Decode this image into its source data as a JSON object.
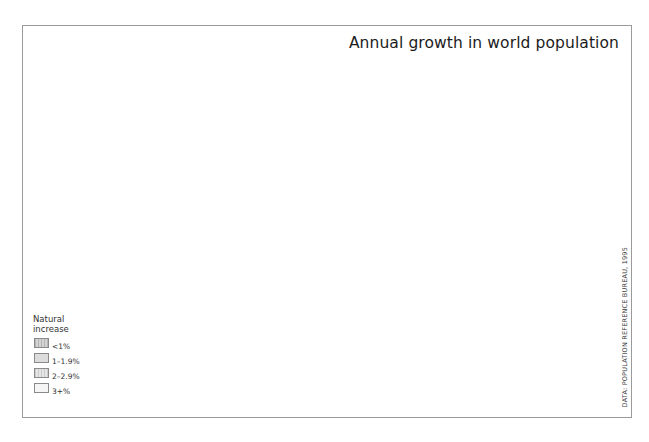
{
  "title": "Annual growth in world population",
  "source": "DATA: POPULATION REFERENCE BUREAU, 1995",
  "legend": {
    "title_line1": "Natural",
    "title_line2": "increase",
    "items": [
      {
        "label": "<1%",
        "pattern": "stripe-dark"
      },
      {
        "label": "1–1.9%",
        "pattern": "solid-grey"
      },
      {
        "label": "2–2.9%",
        "pattern": "stripe-medium"
      },
      {
        "label": "3+%",
        "pattern": "light"
      }
    ]
  },
  "colors": {
    "stripe_dark_a": "#b9b9b9",
    "stripe_dark_b": "#d6d6d6",
    "solid_grey": "#dcdcdc",
    "stripe_medium_a": "#cdcdcd",
    "stripe_medium_b": "#e6e6e6",
    "light": "#f3f3f3",
    "border": "#7a7a7a",
    "ocean": "#ffffff"
  },
  "regions": [
    {
      "name": "North America (USA/Canada)",
      "class": "<1%"
    },
    {
      "name": "Alaska",
      "class": "<1%"
    },
    {
      "name": "Greenland",
      "class": "<1%"
    },
    {
      "name": "Europe",
      "class": "<1%"
    },
    {
      "name": "Russia",
      "class": "<1%"
    },
    {
      "name": "Australia",
      "class": "1–1.9%"
    },
    {
      "name": "China",
      "class": "1–1.9%"
    },
    {
      "name": "India",
      "class": "1–1.9%"
    },
    {
      "name": "Brazil",
      "class": "1–1.9%"
    },
    {
      "name": "Argentina",
      "class": "1–1.9%"
    },
    {
      "name": "Mexico",
      "class": "2–2.9%"
    },
    {
      "name": "Andean South America",
      "class": "2–2.9%"
    },
    {
      "name": "North Africa",
      "class": "2–2.9%"
    },
    {
      "name": "Sub-Saharan Africa",
      "class": "3+%"
    },
    {
      "name": "Middle East",
      "class": "3+%"
    }
  ]
}
